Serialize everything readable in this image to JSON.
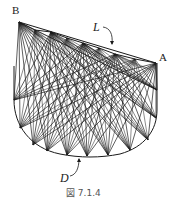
{
  "figure": {
    "caption": "図 7.1.4",
    "labels": {
      "B": "B",
      "A": "A",
      "L": "L",
      "D": "D"
    },
    "colors": {
      "stroke": "#1a1a1a",
      "background": "#ffffff"
    },
    "top_polyline": [
      [
        19,
        22
      ],
      [
        35,
        30
      ],
      [
        51,
        32
      ],
      [
        67,
        38
      ],
      [
        83,
        43
      ],
      [
        99,
        48
      ],
      [
        115,
        54
      ],
      [
        135,
        59
      ],
      [
        156,
        63
      ]
    ],
    "top_hubs": [
      [
        19,
        22
      ],
      [
        51,
        32
      ],
      [
        83,
        43
      ],
      [
        115,
        54
      ],
      [
        156,
        63
      ]
    ],
    "bottom_hubs": [
      [
        14,
        100
      ],
      [
        20,
        128
      ],
      [
        33,
        145
      ],
      [
        47,
        151
      ],
      [
        67,
        155
      ],
      [
        87,
        156
      ],
      [
        108,
        155
      ],
      [
        130,
        150
      ],
      [
        148,
        140
      ],
      [
        156,
        118
      ],
      [
        157,
        90
      ]
    ]
  }
}
